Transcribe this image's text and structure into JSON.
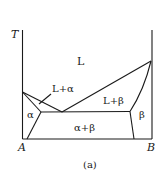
{
  "diagram": {
    "caption": "(a)",
    "axis": {
      "y_label": "T",
      "x_left_label": "A",
      "x_right_label": "B"
    },
    "regions": {
      "liquid": "L",
      "liquid_alpha": "L+α",
      "liquid_beta": "L+β",
      "alpha": "α",
      "beta": "β",
      "alpha_beta": "α+β"
    },
    "type": "binary eutectic phase diagram"
  }
}
